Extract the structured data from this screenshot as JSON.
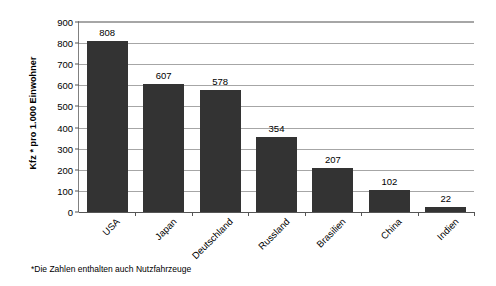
{
  "chart_data": {
    "type": "bar",
    "title": "",
    "subtitle": "",
    "xlabel": "",
    "ylabel": "Kfz * pro 1.000 Einwohner",
    "categories": [
      "USA",
      "Japan",
      "Deutschland",
      "Russland",
      "Brasilien",
      "China",
      "Indien"
    ],
    "values": [
      808,
      607,
      578,
      354,
      207,
      102,
      22
    ],
    "value_labels": [
      "808",
      "607",
      "578",
      "354",
      "207",
      "102",
      "22"
    ],
    "ylim": [
      0,
      900
    ],
    "ytick_step": 100,
    "ytick_labels": [
      "900",
      "800",
      "700",
      "600",
      "500",
      "400",
      "300",
      "200",
      "100",
      "0"
    ],
    "ytick_values": [
      900,
      800,
      700,
      600,
      500,
      400,
      300,
      200,
      100,
      0
    ],
    "grid": "horizontal",
    "legend": "none",
    "bar_color": "#333333",
    "grid_color": "#a6a6a6",
    "axis_color": "#555555",
    "background_color": "#ffffff",
    "annotations": [
      "*Die Zahlen enthalten auch Nutzfahrzeuge"
    ]
  },
  "footnote": "*Die Zahlen enthalten auch Nutzfahrzeuge"
}
